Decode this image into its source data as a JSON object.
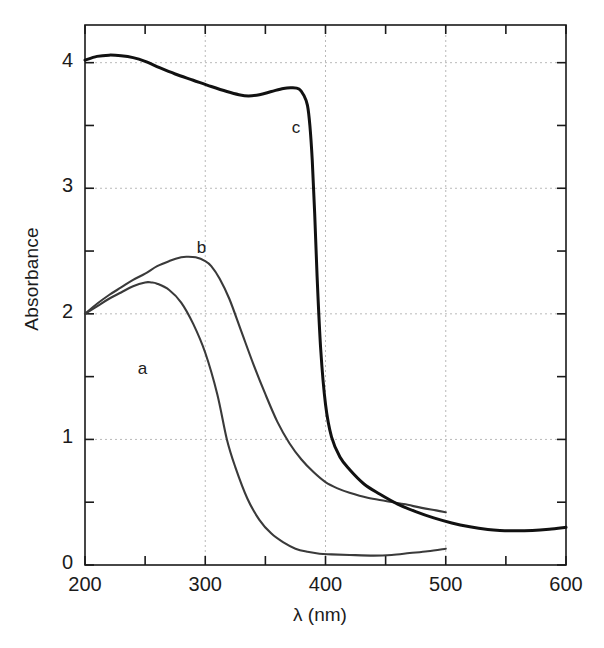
{
  "figure": {
    "background_color": "#ffffff",
    "frame_color": "#1a1a1a",
    "grid_color": "#b9b9b9"
  },
  "axis": {
    "y_title": "Absorbance",
    "x_title": "λ (nm)",
    "y_ticks": [
      "0",
      "1",
      "2",
      "3",
      "4"
    ],
    "x_ticks": [
      "200",
      "300",
      "400",
      "500",
      "600"
    ],
    "y_minor_ticks": [
      0.5,
      1.5,
      2.5,
      3.5
    ],
    "x_minor_ticks": [
      250,
      350,
      450,
      550
    ]
  },
  "curve_labels": {
    "a": "a",
    "b": "b",
    "c": "c"
  },
  "chart_data": {
    "type": "line",
    "title": "",
    "xlabel": "λ (nm)",
    "ylabel": "Absorbance",
    "xlim": [
      200,
      600
    ],
    "ylim": [
      0,
      4.3
    ],
    "grid": true,
    "legend": "inline-curve-labels",
    "xticks": [
      200,
      300,
      400,
      500,
      600
    ],
    "yticks": [
      0,
      1,
      2,
      3,
      4
    ],
    "series": [
      {
        "name": "a",
        "color": "#3a3a3a",
        "line_width": 2.1,
        "x_end": 500,
        "x": [
          200,
          210,
          220,
          230,
          240,
          250,
          255,
          260,
          270,
          280,
          290,
          300,
          310,
          318,
          325,
          335,
          345,
          355,
          365,
          375,
          385,
          395,
          405,
          420,
          440,
          455,
          470,
          485,
          500
        ],
        "y": [
          2.0,
          2.06,
          2.12,
          2.17,
          2.22,
          2.25,
          2.25,
          2.24,
          2.19,
          2.09,
          1.92,
          1.69,
          1.36,
          1.0,
          0.78,
          0.53,
          0.36,
          0.25,
          0.18,
          0.13,
          0.105,
          0.09,
          0.085,
          0.08,
          0.075,
          0.08,
          0.095,
          0.11,
          0.13
        ]
      },
      {
        "name": "b",
        "color": "#3a3a3a",
        "line_width": 2.1,
        "x_end": 500,
        "x": [
          200,
          210,
          220,
          230,
          240,
          250,
          260,
          270,
          280,
          285,
          292,
          300,
          305,
          312,
          320,
          330,
          340,
          350,
          360,
          370,
          380,
          390,
          400,
          410,
          420,
          435,
          450,
          465,
          480,
          492,
          500
        ],
        "y": [
          2.0,
          2.08,
          2.15,
          2.21,
          2.27,
          2.32,
          2.38,
          2.42,
          2.45,
          2.455,
          2.45,
          2.42,
          2.38,
          2.28,
          2.12,
          1.86,
          1.6,
          1.36,
          1.14,
          0.97,
          0.84,
          0.74,
          0.66,
          0.61,
          0.575,
          0.535,
          0.51,
          0.485,
          0.455,
          0.435,
          0.42
        ]
      },
      {
        "name": "c",
        "color": "#111111",
        "line_width": 3.0,
        "x_end": 600,
        "x": [
          200,
          210,
          220,
          230,
          240,
          250,
          262,
          275,
          290,
          305,
          318,
          328,
          336,
          345,
          355,
          365,
          372,
          378,
          382,
          385,
          387,
          389,
          391,
          393,
          396,
          400,
          405,
          412,
          420,
          432,
          445,
          460,
          475,
          490,
          505,
          520,
          535,
          545,
          558,
          572,
          586,
          600
        ],
        "y": [
          4.02,
          4.05,
          4.06,
          4.055,
          4.04,
          4.01,
          3.96,
          3.91,
          3.86,
          3.81,
          3.77,
          3.745,
          3.735,
          3.745,
          3.77,
          3.795,
          3.8,
          3.79,
          3.74,
          3.66,
          3.5,
          3.22,
          2.8,
          2.3,
          1.72,
          1.28,
          1.02,
          0.86,
          0.76,
          0.645,
          0.565,
          0.485,
          0.425,
          0.375,
          0.335,
          0.305,
          0.283,
          0.275,
          0.272,
          0.275,
          0.285,
          0.3
        ]
      }
    ],
    "annotations": [
      {
        "text": "a",
        "x": 248,
        "y": 1.55
      },
      {
        "text": "b",
        "x": 297,
        "y": 2.52
      },
      {
        "text": "c",
        "x": 376,
        "y": 3.47
      }
    ]
  }
}
